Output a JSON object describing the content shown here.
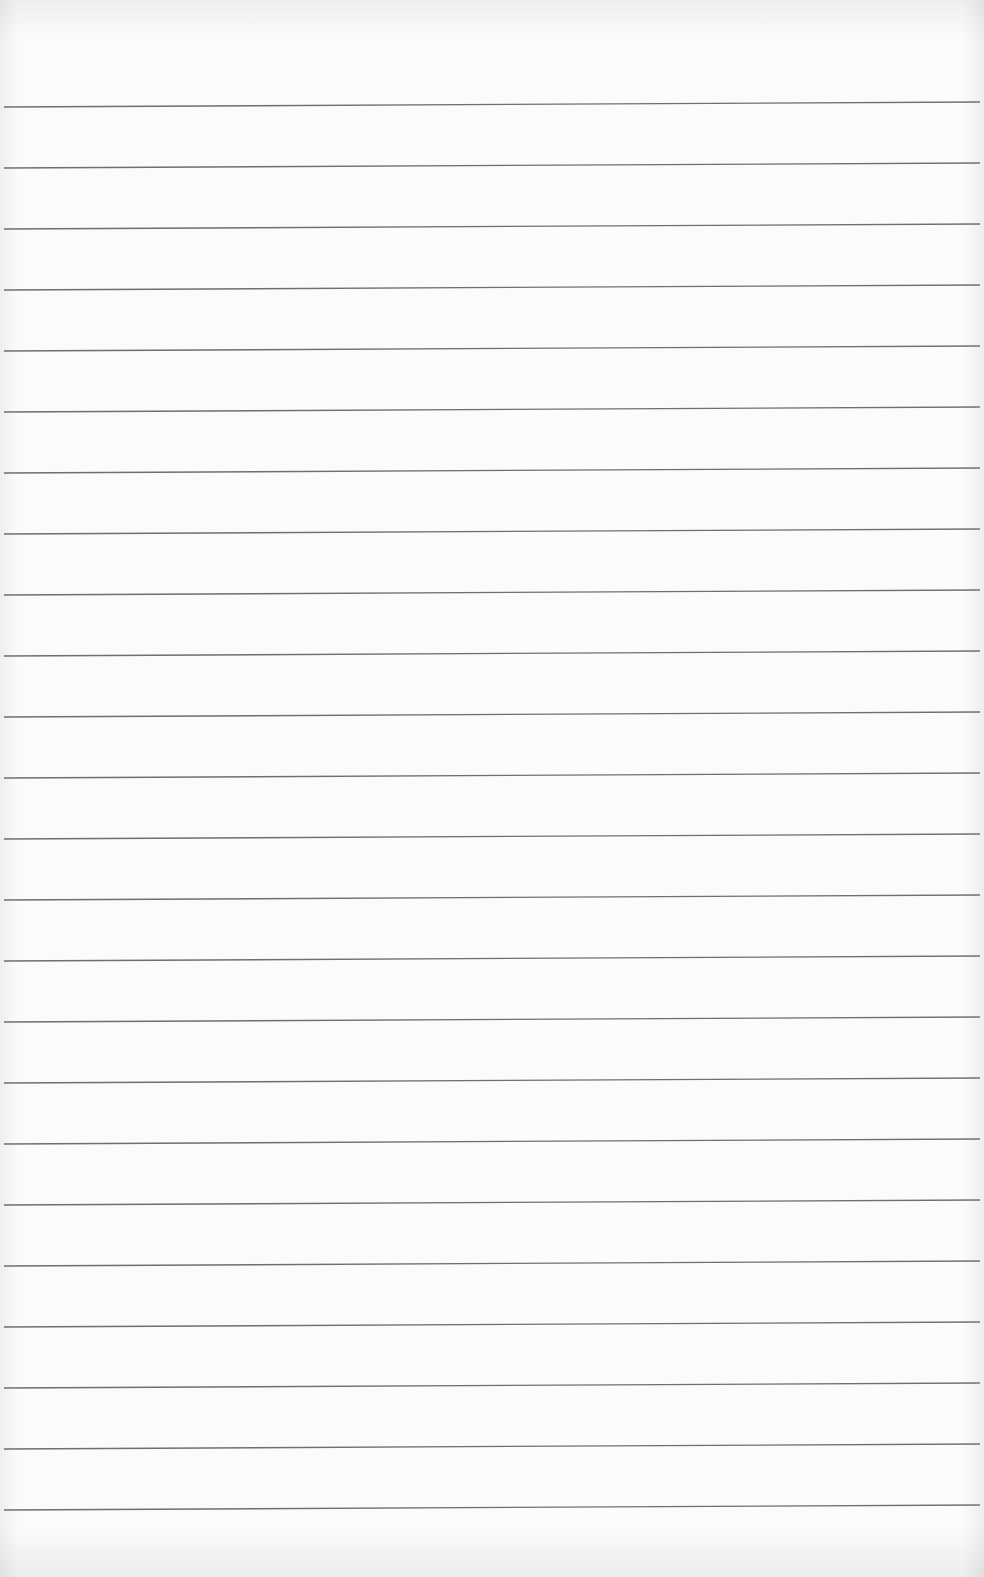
{
  "page": {
    "type": "ruled-paper",
    "background_color": "#fbfbfb",
    "line_color": "#6f6f6f",
    "line_thickness": 1.4,
    "line_start_x": 4,
    "line_end_x": 980,
    "right_side_offset_y": -5,
    "line_count": 24,
    "lines_left_y": [
      107,
      168,
      229,
      290,
      351,
      412,
      473,
      534,
      595,
      656,
      717,
      778,
      839,
      900,
      961,
      1022,
      1083,
      1144,
      1205,
      1266,
      1327,
      1388,
      1449,
      1510
    ]
  }
}
